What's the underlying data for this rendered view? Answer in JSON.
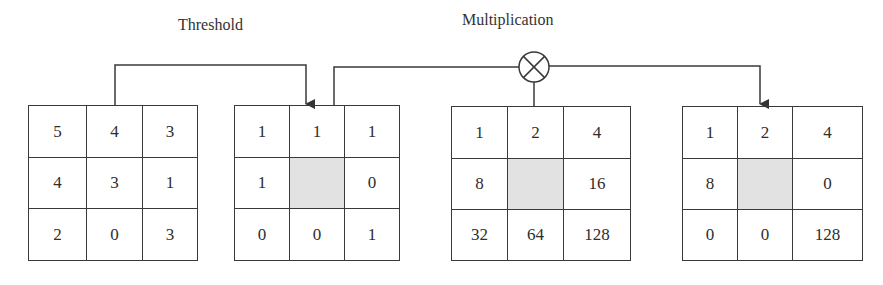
{
  "labels": {
    "threshold": "Threshold",
    "multiplication": "Multiplication"
  },
  "icons": {
    "multiply": "circled-times"
  },
  "colors": {
    "line": "#3a3a3a",
    "shaded_cell": "#e2e2e2"
  },
  "grids": [
    {
      "name": "input-neighborhood",
      "cells": [
        "5",
        "4",
        "3",
        "4",
        "3",
        "1",
        "2",
        "0",
        "3"
      ]
    },
    {
      "name": "threshold-result",
      "cells": [
        "1",
        "1",
        "1",
        "1",
        "",
        "0",
        "0",
        "0",
        "1"
      ]
    },
    {
      "name": "binary-weights",
      "cells": [
        "1",
        "2",
        "4",
        "8",
        "",
        "16",
        "32",
        "64",
        "128"
      ]
    },
    {
      "name": "multiplied-result",
      "cells": [
        "1",
        "2",
        "4",
        "8",
        "",
        "0",
        "0",
        "0",
        "128"
      ]
    }
  ]
}
